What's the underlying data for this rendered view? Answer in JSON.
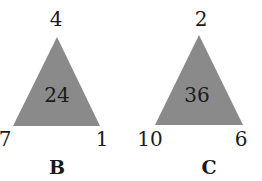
{
  "triangles": [
    {
      "name": "B",
      "top": "4",
      "left": "7",
      "right": "1",
      "center": "24",
      "fill": "#8a8a8a"
    },
    {
      "name": "C",
      "top": "2",
      "left": "10",
      "right": "6",
      "center": "36",
      "fill": "#8a8a8a"
    }
  ]
}
